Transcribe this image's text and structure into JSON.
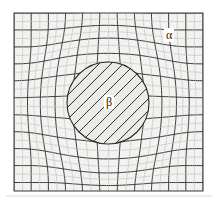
{
  "figure": {
    "type": "deformed-mesh-diagram",
    "background_color": "#ffffff",
    "matrix_fill": "#f2f2f0",
    "inclusion_fill": "#ebebe8",
    "line_color": "#3a3a3a",
    "faint_line_color": "#b9b9b9",
    "separator_color": "#d8d8d8"
  },
  "labels": {
    "alpha": "α",
    "beta": "β"
  },
  "domain": {
    "x_min": 14,
    "y_min": 13,
    "x_max": 203,
    "y_max": 191,
    "columns": 22,
    "rows": 21
  },
  "inclusion": {
    "shape": "circle",
    "center_x": 108,
    "center_y": 103,
    "radius": 41,
    "mesh_rotation_deg": 45,
    "mesh_spacing": 8.5
  },
  "separator": {
    "y": 196
  }
}
